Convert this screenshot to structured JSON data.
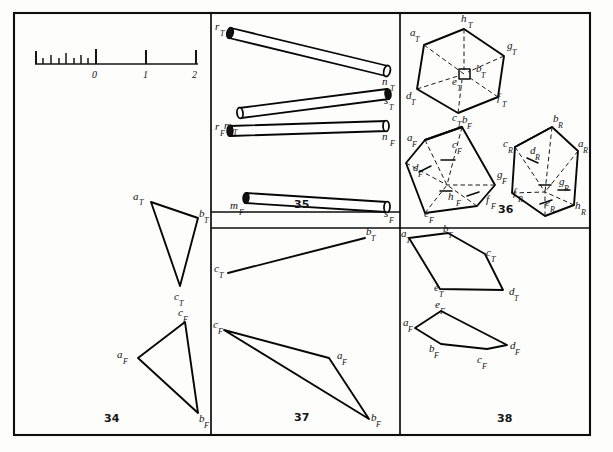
{
  "page": {
    "background_color": "#fdfdfc",
    "ink_color": "#0d0d0d",
    "width": 613,
    "height": 452
  },
  "frame": {
    "x": 14,
    "y": 13,
    "width": 576,
    "height": 422
  },
  "ruler": {
    "name": "graphic-scale",
    "baseline_y": 64,
    "x_start": 35,
    "x_end": 198,
    "labels": [
      {
        "text": "0",
        "value": 0,
        "x": 96,
        "y": 76
      },
      {
        "text": "1",
        "value": 1,
        "x": 147,
        "y": 76
      },
      {
        "text": "2",
        "value": 2,
        "x": 196,
        "y": 76
      }
    ],
    "major_ticks": [
      {
        "x": 35,
        "height": 13
      },
      {
        "x": 96,
        "height": 15
      },
      {
        "x": 146,
        "height": 14
      },
      {
        "x": 196,
        "height": 14
      }
    ],
    "minor_ticks": [
      {
        "x": 43,
        "height": 6
      },
      {
        "x": 51,
        "height": 9
      },
      {
        "x": 59,
        "height": 6
      },
      {
        "x": 66,
        "height": 11
      },
      {
        "x": 74,
        "height": 6
      },
      {
        "x": 81,
        "height": 9
      },
      {
        "x": 88,
        "height": 6
      }
    ]
  },
  "panels": [
    {
      "id": "panel-34",
      "number": "34",
      "number_pos": {
        "x": 110,
        "y": 422
      },
      "bounds": {
        "x": 14,
        "y": 13,
        "width": 197,
        "height": 422
      },
      "description": "Two triangle views, top and front",
      "figures": [
        {
          "name": "triangle-top-view",
          "view": "T",
          "closed": true,
          "points": [
            {
              "label": "a",
              "sub": "T",
              "x": 151,
              "y": 202,
              "label_x": 136,
              "label_y": 200
            },
            {
              "label": "b",
              "sub": "T",
              "x": 198,
              "y": 218,
              "label_x": 201,
              "label_y": 216
            },
            {
              "label": "c",
              "sub": "T",
              "x": 180,
              "y": 286,
              "label_x": 175,
              "label_y": 299
            }
          ]
        },
        {
          "name": "triangle-front-view",
          "view": "F",
          "closed": true,
          "points": [
            {
              "label": "a",
              "sub": "F",
              "x": 138,
              "y": 358,
              "label_x": 120,
              "label_y": 358
            },
            {
              "label": "b",
              "sub": "F",
              "x": 198,
              "y": 413,
              "label_x": 200,
              "label_y": 419
            },
            {
              "label": "c",
              "sub": "F",
              "x": 185,
              "y": 322,
              "label_x": 180,
              "label_y": 315
            }
          ]
        }
      ]
    },
    {
      "id": "panel-35",
      "number": "35",
      "number_pos": {
        "x": 300,
        "y": 208
      },
      "bounds": {
        "x": 211,
        "y": 13,
        "width": 189,
        "height": 199
      },
      "description": "Two crossing cylindrical rods, top and front views",
      "rods": [
        {
          "name": "rod-r-n-top",
          "from": {
            "label": "r",
            "sub": "T",
            "x": 229,
            "y": 31,
            "label_x": 218,
            "label_y": 30
          },
          "to": {
            "label": "n",
            "sub": "T",
            "x": 389,
            "y": 71,
            "label_x": 385,
            "label_y": 86
          }
        },
        {
          "name": "rod-m-s-top",
          "from": {
            "label": "m",
            "sub": "T",
            "x": 240,
            "y": 113,
            "label_x": 228,
            "label_y": 128
          },
          "to": {
            "label": "s",
            "sub": "T",
            "x": 389,
            "y": 94,
            "label_x": 386,
            "label_y": 104
          }
        },
        {
          "name": "rod-r-n-front",
          "from": {
            "label": "r",
            "sub": "F",
            "x": 228,
            "y": 130,
            "label_x": 218,
            "label_y": 131
          },
          "to": {
            "label": "n",
            "sub": "F",
            "x": 387,
            "y": 126,
            "label_x": 385,
            "label_y": 141
          }
        },
        {
          "name": "rod-m-s-front",
          "from": {
            "label": "m",
            "sub": "F",
            "x": 248,
            "y": 198,
            "label_x": 234,
            "label_y": 209
          },
          "to": {
            "label": "s",
            "sub": "F",
            "x": 389,
            "y": 207,
            "label_x": 386,
            "label_y": 216
          }
        }
      ]
    },
    {
      "id": "panel-36",
      "number": "36",
      "number_pos": {
        "x": 503,
        "y": 212
      },
      "bounds": {
        "x": 400,
        "y": 13,
        "width": 190,
        "height": 215
      },
      "description": "Cube shown in three views: top, front and right side",
      "solids": [
        {
          "name": "cube-top-view",
          "view": "T",
          "labels": [
            {
              "label": "a",
              "sub": "T",
              "x": 414,
              "y": 36
            },
            {
              "label": "h",
              "sub": "T",
              "x": 464,
              "y": 22
            },
            {
              "label": "g",
              "sub": "T",
              "x": 505,
              "y": 48
            },
            {
              "label": "b",
              "sub": "T",
              "x": 480,
              "y": 70
            },
            {
              "label": "e",
              "sub": "T",
              "x": 458,
              "y": 83
            },
            {
              "label": "f",
              "sub": "T",
              "x": 493,
              "y": 100
            },
            {
              "label": "c",
              "sub": "T",
              "x": 455,
              "y": 113
            },
            {
              "label": "d",
              "sub": "T",
              "x": 410,
              "y": 97
            }
          ]
        },
        {
          "name": "cube-front-view",
          "view": "F",
          "labels": [
            {
              "label": "b",
              "sub": "F",
              "x": 465,
              "y": 123
            },
            {
              "label": "a",
              "sub": "F",
              "x": 411,
              "y": 140
            },
            {
              "label": "c",
              "sub": "F",
              "x": 456,
              "y": 147
            },
            {
              "label": "d",
              "sub": "F",
              "x": 417,
              "y": 170
            },
            {
              "label": "g",
              "sub": "F",
              "x": 500,
              "y": 177
            },
            {
              "label": "h",
              "sub": "F",
              "x": 452,
              "y": 199
            },
            {
              "label": "f",
              "sub": "F",
              "x": 489,
              "y": 202
            },
            {
              "label": "e",
              "sub": "F",
              "x": 428,
              "y": 215
            }
          ]
        },
        {
          "name": "cube-right-view",
          "view": "R",
          "labels": [
            {
              "label": "b",
              "sub": "R",
              "x": 556,
              "y": 122
            },
            {
              "label": "c",
              "sub": "R",
              "x": 506,
              "y": 146
            },
            {
              "label": "a",
              "sub": "R",
              "x": 581,
              "y": 146
            },
            {
              "label": "d",
              "sub": "R",
              "x": 534,
              "y": 153
            },
            {
              "label": "g",
              "sub": "R",
              "x": 562,
              "y": 184
            },
            {
              "label": "f",
              "sub": "R",
              "x": 517,
              "y": 195
            },
            {
              "label": "e",
              "sub": "R",
              "x": 548,
              "y": 205
            },
            {
              "label": "h",
              "sub": "R",
              "x": 580,
              "y": 208
            }
          ]
        }
      ]
    },
    {
      "id": "panel-37",
      "number": "37",
      "number_pos": {
        "x": 300,
        "y": 420
      },
      "bounds": {
        "x": 211,
        "y": 228,
        "width": 189,
        "height": 207
      },
      "description": "Edge view line in top view and triangle in front view",
      "figures": [
        {
          "name": "line-top-view",
          "view": "T",
          "closed": false,
          "points": [
            {
              "label": "c",
              "sub": "T",
              "x": 228,
              "y": 273,
              "label_x": 216,
              "label_y": 272
            },
            {
              "label": "b",
              "sub": "T",
              "x": 365,
              "y": 238,
              "label_x": 366,
              "label_y": 235
            }
          ]
        },
        {
          "name": "triangle-front-view",
          "view": "F",
          "closed": true,
          "points": [
            {
              "label": "c",
              "sub": "F",
              "x": 224,
              "y": 330,
              "label_x": 215,
              "label_y": 327
            },
            {
              "label": "a",
              "sub": "F",
              "x": 329,
              "y": 358,
              "label_x": 340,
              "label_y": 360
            },
            {
              "label": "b",
              "sub": "F",
              "x": 369,
              "y": 419,
              "label_x": 371,
              "label_y": 420
            }
          ]
        }
      ]
    },
    {
      "id": "panel-38",
      "number": "38",
      "number_pos": {
        "x": 503,
        "y": 421
      },
      "bounds": {
        "x": 400,
        "y": 228,
        "width": 190,
        "height": 207
      },
      "description": "Pentagonal plane figure in top and front views",
      "figures": [
        {
          "name": "pentagon-top-view",
          "view": "T",
          "closed": true,
          "points": [
            {
              "label": "a",
              "sub": "T",
              "x": 409,
              "y": 238,
              "label_x": 403,
              "label_y": 236
            },
            {
              "label": "b",
              "sub": "T",
              "x": 448,
              "y": 233,
              "label_x": 443,
              "label_y": 231
            },
            {
              "label": "c",
              "sub": "T",
              "x": 485,
              "y": 254,
              "label_x": 487,
              "label_y": 255
            },
            {
              "label": "d",
              "sub": "T",
              "x": 503,
              "y": 290,
              "label_x": 510,
              "label_y": 294
            },
            {
              "label": "e",
              "sub": "T",
              "x": 440,
              "y": 289,
              "label_x": 437,
              "label_y": 290
            }
          ]
        },
        {
          "name": "pentagon-front-view",
          "view": "F",
          "closed": true,
          "points": [
            {
              "label": "a",
              "sub": "F",
              "x": 415,
              "y": 328,
              "label_x": 404,
              "label_y": 325
            },
            {
              "label": "b",
              "sub": "F",
              "x": 441,
              "y": 344,
              "label_x": 433,
              "label_y": 351
            },
            {
              "label": "c",
              "sub": "F",
              "x": 487,
              "y": 349,
              "label_x": 481,
              "label_y": 362
            },
            {
              "label": "d",
              "sub": "F",
              "x": 507,
              "y": 345,
              "label_x": 510,
              "label_y": 348
            },
            {
              "label": "e",
              "sub": "F",
              "x": 441,
              "y": 311,
              "label_x": 438,
              "label_y": 307
            }
          ]
        }
      ]
    }
  ]
}
